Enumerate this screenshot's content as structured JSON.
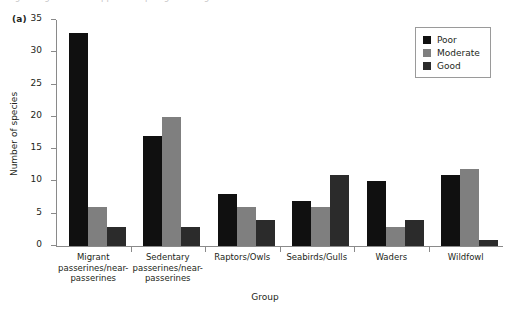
{
  "panel": {
    "label": "(a)"
  },
  "caption": {
    "cutoff_text": "Figure legend text cropped at top edge of image"
  },
  "chart_data": {
    "type": "bar",
    "title": "",
    "xlabel": "Group",
    "ylabel": "Number of species",
    "ylim": [
      0,
      35
    ],
    "yticks": [
      0,
      5,
      10,
      15,
      20,
      25,
      30,
      35
    ],
    "grid": false,
    "legend_position": "top-right",
    "categories": [
      "Migrant passerines/near-passerines",
      "Sedentary passerines/near-passerines",
      "Raptors/Owls",
      "Seabirds/Gulls",
      "Waders",
      "Wildfowl"
    ],
    "category_lines": [
      [
        "Migrant",
        "passerines/near-",
        "passerines"
      ],
      [
        "Sedentary",
        "passerines/near-",
        "passerines"
      ],
      [
        "Raptors/Owls"
      ],
      [
        "Seabirds/Gulls"
      ],
      [
        "Waders"
      ],
      [
        "Wildfowl"
      ]
    ],
    "series": [
      {
        "name": "Poor",
        "color": "#101010",
        "values": [
          33,
          17,
          8,
          7,
          10,
          11
        ]
      },
      {
        "name": "Moderate",
        "color": "#7f7f7f",
        "values": [
          6,
          20,
          6,
          6,
          3,
          12
        ]
      },
      {
        "name": "Good",
        "color": "#2b2b2b",
        "values": [
          3,
          3,
          4,
          11,
          4,
          1
        ]
      }
    ]
  },
  "legend": {
    "items": [
      {
        "label": "Poor",
        "color": "#101010"
      },
      {
        "label": "Moderate",
        "color": "#7f7f7f"
      },
      {
        "label": "Good",
        "color": "#2b2b2b"
      }
    ]
  }
}
